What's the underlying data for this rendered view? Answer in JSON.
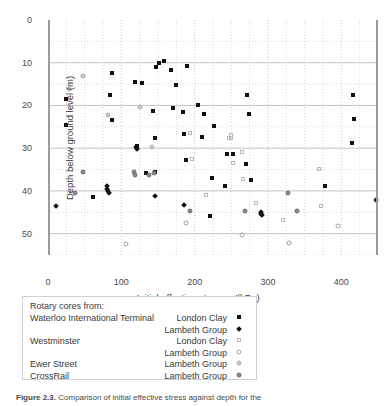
{
  "chart_data": {
    "type": "scatter",
    "title": "",
    "xlabel": "Initial effective stress,  p'(kPa)",
    "xlabel_plain": "Initial effective stress,",
    "xlabel_symbol": "p'",
    "xlabel_units": "(kPa)",
    "ylabel": "Depth below ground level (m)",
    "xlim": [
      0,
      450
    ],
    "ylim": [
      0,
      55
    ],
    "y_inverted": true,
    "xticks": [
      0,
      100,
      200,
      300,
      400
    ],
    "yticks": [
      0,
      10,
      20,
      30,
      40,
      50
    ],
    "x_minor_step": 25,
    "y_minor_step": 5,
    "grid": true,
    "grid_style": "dotted-minor-and-major",
    "legend_position": "below-plot",
    "series": [
      {
        "name": "Waterloo International Terminal - London Clay",
        "site": "Waterloo International Terminal",
        "unit": "London Clay",
        "marker": "sq-filled",
        "color": "#101010",
        "points": [
          [
            24,
            18.5
          ],
          [
            25,
            24.5
          ],
          [
            62,
            41.5
          ],
          [
            87,
            12.5
          ],
          [
            85,
            17.5
          ],
          [
            87,
            23.5
          ],
          [
            118,
            14.5
          ],
          [
            122,
            29.6
          ],
          [
            121,
            30.0
          ],
          [
            128,
            14.8
          ],
          [
            133,
            35.8
          ],
          [
            143,
            21.4
          ],
          [
            146,
            27.5
          ],
          [
            146,
            35.5
          ],
          [
            147,
            11.0
          ],
          [
            152,
            10.0
          ],
          [
            158,
            9.5
          ],
          [
            168,
            11.8
          ],
          [
            170,
            20.7
          ],
          [
            175,
            15.3
          ],
          [
            184,
            21.6
          ],
          [
            186,
            26.6
          ],
          [
            188,
            32.7
          ],
          [
            189,
            10.8
          ],
          [
            205,
            19.8
          ],
          [
            210,
            27.4
          ],
          [
            213,
            22.1
          ],
          [
            221,
            45.8
          ],
          [
            223,
            37.0
          ],
          [
            227,
            24.9
          ],
          [
            242,
            38.8
          ],
          [
            244,
            31.4
          ],
          [
            252,
            31.4
          ],
          [
            270,
            33.6
          ],
          [
            272,
            17.5
          ],
          [
            274,
            21.9
          ],
          [
            277,
            37.5
          ],
          [
            378,
            38.9
          ],
          [
            416,
            17.5
          ],
          [
            417,
            23.1
          ],
          [
            414,
            28.7
          ]
        ]
      },
      {
        "name": "Waterloo International Terminal - Lambeth Group",
        "site": "Waterloo International Terminal",
        "unit": "Lambeth Group",
        "marker": "dia-filled",
        "color": "#101010",
        "points": [
          [
            11,
            43.5
          ],
          [
            80,
            38.9
          ],
          [
            81,
            39.6
          ],
          [
            82,
            40.1
          ],
          [
            83,
            40.6
          ],
          [
            120,
            29.7
          ],
          [
            121,
            30.2
          ],
          [
            146,
            41.2
          ],
          [
            186,
            43.3
          ],
          [
            290,
            45.3
          ],
          [
            292,
            45.6
          ],
          [
            291,
            45.0
          ],
          [
            447,
            42.2
          ]
        ]
      },
      {
        "name": "Westminster - London Clay",
        "site": "Westminster",
        "unit": "London Clay",
        "marker": "sq-open",
        "color": "#b9b9b9",
        "points": [
          [
            193,
            26.5
          ],
          [
            196,
            32.5
          ],
          [
            215,
            41.0
          ],
          [
            247,
            27.7
          ],
          [
            250,
            27.5
          ],
          [
            249,
            26.9
          ],
          [
            252,
            33.5
          ],
          [
            264,
            30.8
          ],
          [
            266,
            37.2
          ],
          [
            284,
            42.8
          ],
          [
            320,
            46.8
          ],
          [
            370,
            34.8
          ],
          [
            372,
            43.5
          ]
        ]
      },
      {
        "name": "Westminster - Lambeth Group",
        "site": "Westminster",
        "unit": "Lambeth Group",
        "marker": "cir-open",
        "color": "#a3a3a3",
        "points": [
          [
            106,
            52.4
          ],
          [
            188,
            47.5
          ],
          [
            264,
            50.4
          ],
          [
            328,
            52.3
          ],
          [
            396,
            48.3
          ]
        ]
      },
      {
        "name": "Ewer Street - Lambeth Group",
        "site": "Ewer Street",
        "unit": "Lambeth Group",
        "marker": "cir-grey",
        "color": "#c9c9c9",
        "points": [
          [
            28,
            16.2
          ],
          [
            48,
            13.2
          ],
          [
            82,
            22.3
          ],
          [
            125,
            20.3
          ],
          [
            142,
            29.8
          ]
        ]
      },
      {
        "name": "CrossRail - Lambeth Group",
        "site": "CrossRail",
        "unit": "Lambeth Group",
        "marker": "cir-dark",
        "color": "#8c8c8c",
        "points": [
          [
            37,
            40.4
          ],
          [
            48,
            35.5
          ],
          [
            117,
            35.6
          ],
          [
            118,
            36.2
          ],
          [
            138,
            36.3
          ],
          [
            145,
            35.8
          ],
          [
            193,
            44.8
          ],
          [
            269,
            44.7
          ],
          [
            327,
            40.4
          ],
          [
            340,
            44.8
          ]
        ]
      }
    ]
  },
  "legend": {
    "title": "Rotary cores from:",
    "rows": [
      {
        "site": "Waterloo International Terminal",
        "unit": "London Clay",
        "marker": "sq-filled"
      },
      {
        "site": "",
        "unit": "Lambeth Group",
        "marker": "dia-filled"
      },
      {
        "site": "Westminster",
        "unit": "London Clay",
        "marker": "sq-open"
      },
      {
        "site": "",
        "unit": "Lambeth Group",
        "marker": "cir-open"
      },
      {
        "site": "Ewer Street",
        "unit": "Lambeth Group",
        "marker": "cir-grey"
      },
      {
        "site": "CrossRail",
        "unit": "Lambeth Group",
        "marker": "cir-dark"
      }
    ]
  },
  "caption": {
    "label": "Figure 2.3.",
    "text": "Comparison of initial effective stress against depth for the"
  }
}
